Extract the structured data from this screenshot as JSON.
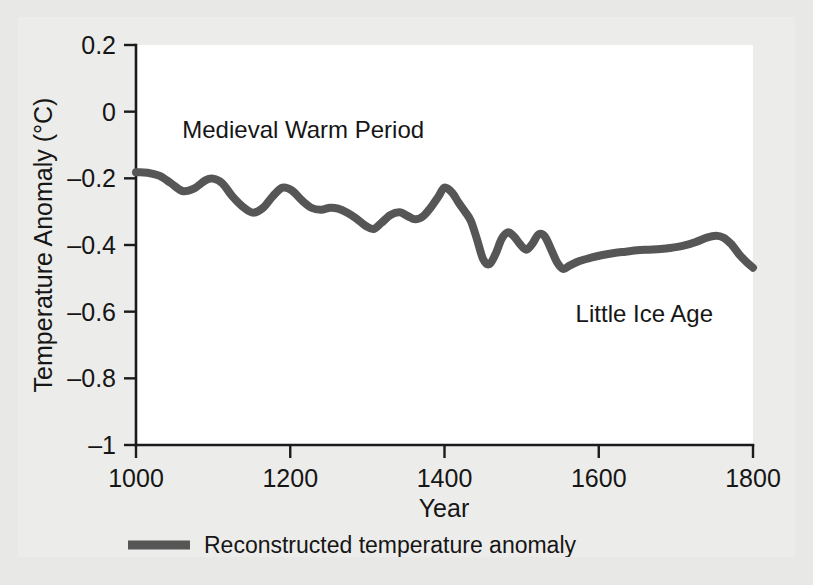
{
  "figure": {
    "background_color": "#e8e8e6",
    "panel_color": "#ececea",
    "plot_background_color": "#ffffff"
  },
  "axes": {
    "y_title": "Temperature Anomaly (°C)",
    "x_title": "Year",
    "y_ticks": [
      "0.2",
      "0",
      "–0.2",
      "–0.4",
      "–0.6",
      "–0.8",
      "–1"
    ],
    "x_ticks": [
      "1000",
      "1200",
      "1400",
      "1600",
      "1800"
    ]
  },
  "annotations": [
    {
      "text": "Medieval Warm Period",
      "x_year": 1060,
      "y_value": -0.08
    },
    {
      "text": "Little Ice Age",
      "x_year": 1570,
      "y_value": -0.63
    }
  ],
  "legend": {
    "entries": [
      {
        "label": "Reconstructed temperature anomaly",
        "color": "#565656"
      }
    ]
  },
  "chart_data": {
    "type": "line",
    "title": "",
    "xlabel": "Year",
    "ylabel": "Temperature Anomaly (°C)",
    "xlim": [
      1000,
      1800
    ],
    "ylim": [
      -1,
      0.2
    ],
    "grid": false,
    "legend_position": "below-axes",
    "series": [
      {
        "name": "Reconstructed temperature anomaly",
        "color": "#565656",
        "x": [
          1000,
          1015,
          1030,
          1045,
          1060,
          1075,
          1090,
          1100,
          1112,
          1125,
          1140,
          1152,
          1165,
          1178,
          1190,
          1202,
          1215,
          1228,
          1240,
          1252,
          1262,
          1274,
          1286,
          1298,
          1308,
          1318,
          1330,
          1342,
          1352,
          1362,
          1372,
          1382,
          1392,
          1400,
          1410,
          1418,
          1426,
          1434,
          1442,
          1450,
          1458,
          1466,
          1474,
          1482,
          1490,
          1498,
          1506,
          1514,
          1522,
          1530,
          1538,
          1546,
          1554,
          1562,
          1575,
          1590,
          1605,
          1620,
          1635,
          1650,
          1665,
          1680,
          1695,
          1710,
          1725,
          1740,
          1752,
          1762,
          1772,
          1782,
          1792,
          1800
        ],
        "y": [
          -0.182,
          -0.183,
          -0.192,
          -0.214,
          -0.238,
          -0.231,
          -0.206,
          -0.201,
          -0.215,
          -0.254,
          -0.288,
          -0.303,
          -0.288,
          -0.252,
          -0.228,
          -0.236,
          -0.266,
          -0.289,
          -0.294,
          -0.288,
          -0.291,
          -0.303,
          -0.321,
          -0.343,
          -0.352,
          -0.334,
          -0.31,
          -0.302,
          -0.313,
          -0.323,
          -0.314,
          -0.288,
          -0.255,
          -0.228,
          -0.243,
          -0.272,
          -0.298,
          -0.327,
          -0.382,
          -0.442,
          -0.458,
          -0.428,
          -0.382,
          -0.362,
          -0.374,
          -0.398,
          -0.414,
          -0.396,
          -0.368,
          -0.374,
          -0.412,
          -0.452,
          -0.472,
          -0.462,
          -0.448,
          -0.438,
          -0.43,
          -0.424,
          -0.42,
          -0.416,
          -0.414,
          -0.412,
          -0.408,
          -0.402,
          -0.392,
          -0.378,
          -0.372,
          -0.378,
          -0.398,
          -0.428,
          -0.452,
          -0.468
        ]
      }
    ]
  }
}
